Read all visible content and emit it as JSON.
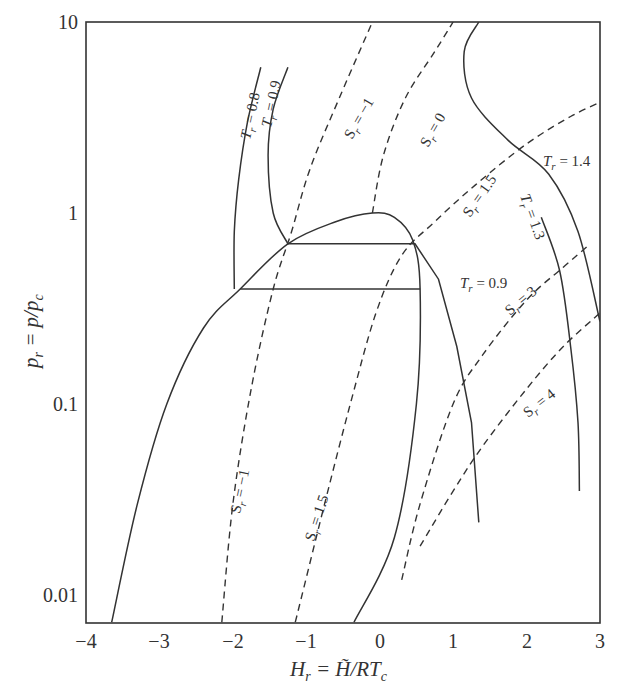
{
  "chart_data": {
    "type": "line",
    "title": "",
    "xlabel": "H_r = H̃/RT_c",
    "ylabel": "p_r = p/p_c",
    "xscale": "linear",
    "yscale": "log",
    "xlim": [
      -4,
      3
    ],
    "ylim": [
      0.0072,
      10
    ],
    "grid": false,
    "x_ticks": [
      "-4",
      "-3",
      "-2",
      "-1",
      "0",
      "1",
      "2",
      "3"
    ],
    "y_ticks": [
      "10",
      "1",
      "0.1",
      "0.01"
    ],
    "legend": null,
    "series": [
      {
        "name": "Saturation dome (two-phase envelope)",
        "style": "solid",
        "points": [
          [
            -3.65,
            0.0072
          ],
          [
            -3.3,
            0.03
          ],
          [
            -2.9,
            0.1
          ],
          [
            -2.4,
            0.25
          ],
          [
            -1.9,
            0.4
          ],
          [
            -1.25,
            0.69
          ],
          [
            -0.6,
            0.9
          ],
          [
            -0.1,
            1.0
          ],
          [
            0.2,
            0.95
          ],
          [
            0.45,
            0.72
          ],
          [
            0.55,
            0.4
          ],
          [
            0.5,
            0.1
          ],
          [
            0.2,
            0.02
          ],
          [
            -0.35,
            0.0072
          ]
        ]
      },
      {
        "name": "T_r = 0.8",
        "style": "solid",
        "points": [
          [
            -1.98,
            0.4
          ],
          [
            -1.98,
            0.8
          ],
          [
            -1.92,
            1.5
          ],
          [
            -1.8,
            3.0
          ],
          [
            -1.62,
            5.8
          ]
        ]
      },
      {
        "name": "T_r = 0.8 tie line",
        "style": "solid",
        "points": [
          [
            -1.9,
            0.4
          ],
          [
            0.55,
            0.4
          ]
        ]
      },
      {
        "name": "T_r = 0.9",
        "style": "solid",
        "points": [
          [
            -1.25,
            0.69
          ],
          [
            -1.45,
            1.0
          ],
          [
            -1.52,
            2.0
          ],
          [
            -1.45,
            3.5
          ],
          [
            -1.25,
            5.8
          ]
        ]
      },
      {
        "name": "T_r = 0.9 tie line and vapor branch",
        "style": "solid",
        "points": [
          [
            -1.25,
            0.69
          ],
          [
            0.48,
            0.69
          ],
          [
            0.8,
            0.45
          ],
          [
            1.05,
            0.2
          ],
          [
            1.25,
            0.08
          ],
          [
            1.35,
            0.024
          ]
        ]
      },
      {
        "name": "T_r = 1.3",
        "style": "solid",
        "points": [
          [
            2.2,
            0.95
          ],
          [
            2.45,
            0.5
          ],
          [
            2.6,
            0.2
          ],
          [
            2.7,
            0.08
          ],
          [
            2.72,
            0.035
          ]
        ]
      },
      {
        "name": "T_r = 1.4",
        "style": "solid",
        "points": [
          [
            1.35,
            10.0
          ],
          [
            1.15,
            7.0
          ],
          [
            1.25,
            4.0
          ],
          [
            1.75,
            2.4
          ],
          [
            2.3,
            1.6
          ],
          [
            2.7,
            0.8
          ],
          [
            3.0,
            0.27
          ]
        ]
      },
      {
        "name": "S_r = -1",
        "style": "dashed",
        "points": [
          [
            -2.15,
            0.0072
          ],
          [
            -2.0,
            0.03
          ],
          [
            -1.75,
            0.12
          ],
          [
            -1.45,
            0.4
          ],
          [
            -1.2,
            0.8
          ],
          [
            -0.95,
            1.7
          ],
          [
            -0.55,
            4.0
          ],
          [
            -0.1,
            10.0
          ]
        ]
      },
      {
        "name": "S_r = 0",
        "style": "dashed",
        "points": [
          [
            -0.1,
            1.0
          ],
          [
            0.05,
            2.0
          ],
          [
            0.35,
            4.0
          ],
          [
            0.75,
            7.0
          ],
          [
            1.0,
            10.0
          ]
        ]
      },
      {
        "name": "S_r = 1.5",
        "style": "dashed",
        "points": [
          [
            -1.15,
            0.0072
          ],
          [
            -0.75,
            0.03
          ],
          [
            -0.4,
            0.1
          ],
          [
            -0.05,
            0.3
          ],
          [
            0.3,
            0.6
          ],
          [
            0.75,
            0.9
          ],
          [
            1.3,
            1.4
          ],
          [
            2.0,
            2.3
          ],
          [
            2.6,
            3.2
          ],
          [
            3.0,
            3.8
          ]
        ]
      },
      {
        "name": "S_r = 3",
        "style": "dashed",
        "points": [
          [
            0.3,
            0.012
          ],
          [
            0.55,
            0.03
          ],
          [
            1.0,
            0.1
          ],
          [
            1.4,
            0.18
          ],
          [
            2.0,
            0.35
          ],
          [
            2.5,
            0.52
          ],
          [
            2.85,
            0.68
          ]
        ]
      },
      {
        "name": "S_r = 4",
        "style": "dashed",
        "points": [
          [
            0.55,
            0.018
          ],
          [
            1.0,
            0.035
          ],
          [
            1.4,
            0.06
          ],
          [
            2.0,
            0.12
          ],
          [
            2.5,
            0.2
          ],
          [
            3.0,
            0.3
          ],
          [
            3.1,
            0.33
          ]
        ]
      }
    ],
    "annotations": [
      {
        "text": "T_r = 0.8",
        "near": [
          -1.9,
          3.5
        ]
      },
      {
        "text": "T_r = 0.9 (liquid)",
        "near": [
          -1.6,
          3.8
        ]
      },
      {
        "text": "S_r = -1 (upper)",
        "near": [
          -0.6,
          3.5
        ]
      },
      {
        "text": "S_r = 0",
        "near": [
          0.4,
          2.8
        ]
      },
      {
        "text": "T_r = 1.4",
        "near": [
          2.5,
          1.6
        ]
      },
      {
        "text": "S_r = 1.5 (upper)",
        "near": [
          1.0,
          0.95
        ]
      },
      {
        "text": "T_r = 1.3",
        "near": [
          1.8,
          0.95
        ]
      },
      {
        "text": "T_r = 0.9 (vapor)",
        "near": [
          1.1,
          0.38
        ]
      },
      {
        "text": "S_r = 3",
        "near": [
          1.6,
          0.28
        ]
      },
      {
        "text": "S_r = 4",
        "near": [
          1.9,
          0.09
        ]
      },
      {
        "text": "S_r = -1 (lower)",
        "near": [
          -1.8,
          0.05
        ]
      },
      {
        "text": "S_r = 1.5 (lower)",
        "near": [
          -0.9,
          0.04
        ]
      }
    ]
  },
  "axes": {
    "x_label_main": "H",
    "x_label_sub": "r",
    "x_label_rest": " = H̃/RT",
    "x_label_sub2": "c",
    "y_label_main": "p",
    "y_label_sub": "r",
    "y_label_rest": " = p/p",
    "y_label_sub2": "c",
    "x_ticks": [
      "−4",
      "−3",
      "−2",
      "−1",
      "0",
      "1",
      "2",
      "3"
    ],
    "y_ticks": [
      "10",
      "1",
      "0.1",
      "0.01"
    ]
  },
  "labels": {
    "tr08": "T",
    "tr08_sub": "r",
    "tr08_val": " = 0.8",
    "tr09a": "T",
    "tr09a_sub": "r",
    "tr09a_val": " = 0.9",
    "sr_m1_top": "S",
    "sr_m1_top_sub": "r",
    "sr_m1_top_val": " = −1",
    "sr_0": "S",
    "sr_0_sub": "r",
    "sr_0_val": " = 0",
    "tr14": "T",
    "tr14_sub": "r",
    "tr14_val": " = 1.4",
    "sr_15_top": "S",
    "sr_15_top_sub": "r",
    "sr_15_top_val": " = 1.5",
    "tr13": "T",
    "tr13_sub": "r",
    "tr13_val": " = 1.3",
    "tr09b": "T",
    "tr09b_sub": "r",
    "tr09b_val": " = 0.9",
    "sr_3": "S",
    "sr_3_sub": "r",
    "sr_3_val": " = 3",
    "sr_4": "S",
    "sr_4_sub": "r",
    "sr_4_val": " = 4",
    "sr_m1_low": "S",
    "sr_m1_low_sub": "r",
    "sr_m1_low_val": " = −1",
    "sr_15_low": "S",
    "sr_15_low_sub": "r",
    "sr_15_low_val": " = 1.5"
  },
  "colors": {
    "line": "#333333",
    "background": "#ffffff"
  }
}
